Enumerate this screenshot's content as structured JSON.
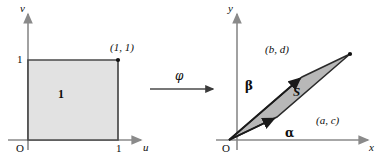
{
  "figure": {
    "background_color": "#ffffff",
    "stroke_color": "#3a3a3a",
    "axis_color": "#8a8a8a",
    "fill_color": "#d4d4d4",
    "width": 387,
    "height": 166
  },
  "left_panel": {
    "name": "unit-square-uv-plane",
    "axes": {
      "vertical_label": "v",
      "horizontal_label": "u",
      "origin_label": "O"
    },
    "ticks": {
      "vertical": "1",
      "horizontal": "1"
    },
    "corner_point_label": "(1, 1)",
    "region_label": "1"
  },
  "map": {
    "symbol": "φ"
  },
  "right_panel": {
    "name": "parallelogram-xy-plane",
    "axes": {
      "vertical_label": "y",
      "horizontal_label": "x",
      "origin_label": "O"
    },
    "region_label": "S",
    "vectors": [
      {
        "name": "alpha",
        "symbol": "α",
        "endpoint_label": "(a, c)"
      },
      {
        "name": "beta",
        "symbol": "β",
        "endpoint_label": "(b, d)"
      }
    ]
  }
}
